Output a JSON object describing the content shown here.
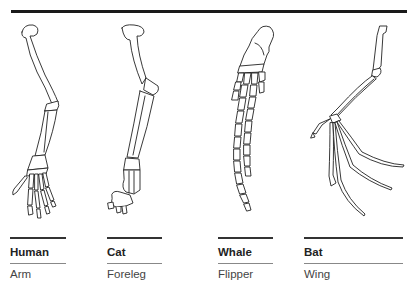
{
  "figure": {
    "limbs": [
      {
        "animal": "Human",
        "structure": "Arm"
      },
      {
        "animal": "Cat",
        "structure": "Foreleg"
      },
      {
        "animal": "Whale",
        "structure": "Flipper"
      },
      {
        "animal": "Bat",
        "structure": "Wing"
      }
    ]
  },
  "colors": {
    "line": "#222222",
    "rule": "#1a1a1a",
    "sub_rule": "#888888",
    "background": "#ffffff"
  }
}
